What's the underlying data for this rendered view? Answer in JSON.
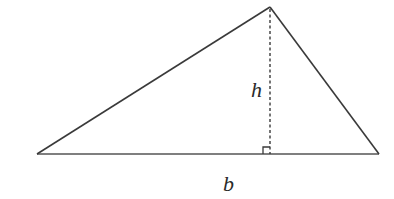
{
  "diagram": {
    "type": "triangle-area",
    "colors": {
      "stroke": "#3a3a3a",
      "base_stroke": "#555555",
      "text": "#2a2a2a",
      "background": "#ffffff"
    },
    "vertices": {
      "left": [
        37,
        154
      ],
      "apex": [
        270,
        7
      ],
      "right": [
        379,
        154
      ]
    },
    "foot_of_altitude": [
      270,
      154
    ],
    "labels": {
      "height": "h",
      "base": "b"
    },
    "label_positions": {
      "height": [
        251,
        97
      ],
      "base": [
        223,
        191
      ]
    },
    "right_angle_marker": {
      "x": 263,
      "y": 147,
      "size": 7
    }
  }
}
